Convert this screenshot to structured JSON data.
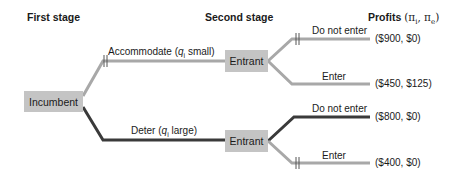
{
  "headers": {
    "first_stage": "First stage",
    "second_stage": "Second stage",
    "profits": "Profits",
    "profits_vars": "(π",
    "profits_i": "i",
    "profits_sep": ", π",
    "profits_e": "e",
    "profits_close": ")"
  },
  "nodes": {
    "incumbent": "Incumbent",
    "entrant_upper": "Entrant",
    "entrant_lower": "Entrant"
  },
  "branches": {
    "accommodate": {
      "prefix": "Accommodate (",
      "var": "q",
      "sub": "i",
      "suffix": " small)"
    },
    "deter": {
      "prefix": "Deter (",
      "var": "q",
      "sub": "i",
      "suffix": " large)"
    },
    "upper_do_not_enter": "Do not enter",
    "upper_enter": "Enter",
    "lower_do_not_enter": "Do not enter",
    "lower_enter": "Enter"
  },
  "payoffs": {
    "upper_do_not_enter": "($900, $0)",
    "upper_enter": "($450, $125)",
    "lower_do_not_enter": "($800, $0)",
    "lower_enter": "($400, $0)"
  },
  "colors": {
    "pruned_branch": "#a8a8a8",
    "equilibrium_branch": "#3a3a3a",
    "node_fill": "#c4c4c4"
  }
}
